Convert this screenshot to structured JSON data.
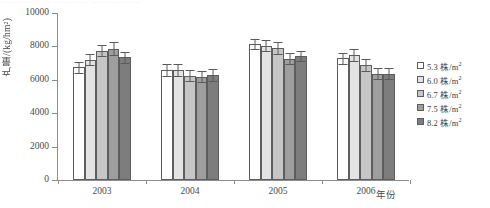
{
  "figure": {
    "top_artifact_text": "·· ··· ····· ···· ·· ···                    ···· ···· ···· ·· ···· ··· ··",
    "background_color": "#ffffff"
  },
  "chart_data": {
    "type": "bar",
    "title": "",
    "subtitle": "",
    "xlabel": "年份",
    "ylabel": "产量/(kg/hm²)",
    "categories": [
      "2003",
      "2004",
      "2005",
      "2006"
    ],
    "ylim": [
      0,
      10000
    ],
    "ytick_values": [
      0,
      2000,
      4000,
      6000,
      8000,
      10000
    ],
    "ytick_labels": [
      "0",
      "2000",
      "4000",
      "6000",
      "8000",
      "10000"
    ],
    "grid": false,
    "legend_position": "right",
    "error_bars": true,
    "series": [
      {
        "name": "5.3 株/m²",
        "color": "#ffffff",
        "values": [
          6750,
          6600,
          8130,
          7300
        ],
        "errors": [
          330,
          350,
          300,
          330
        ]
      },
      {
        "name": "6.0 株/m²",
        "color": "#e3e3e3",
        "values": [
          7200,
          6600,
          8050,
          7500
        ],
        "errors": [
          330,
          350,
          330,
          370
        ]
      },
      {
        "name": "6.7 株/m²",
        "color": "#c6c6c6",
        "values": [
          7750,
          6250,
          7900,
          6900
        ],
        "errors": [
          350,
          330,
          350,
          350
        ]
      },
      {
        "name": "7.5 株/m²",
        "color": "#9e9e9e",
        "values": [
          7870,
          6180,
          7250,
          6350
        ],
        "errors": [
          400,
          330,
          330,
          330
        ]
      },
      {
        "name": "8.2 株/m²",
        "color": "#7d7d7d",
        "values": [
          7350,
          6300,
          7400,
          6350
        ],
        "errors": [
          330,
          350,
          300,
          330
        ]
      }
    ]
  },
  "legend": {
    "items": [
      {
        "label": "5.3 株/m",
        "sup": "2",
        "color": "#ffffff"
      },
      {
        "label": "6.0 株/m",
        "sup": "2",
        "color": "#e3e3e3"
      },
      {
        "label": "6.7 株/m",
        "sup": "2",
        "color": "#c6c6c6"
      },
      {
        "label": "7.5 株/m",
        "sup": "2",
        "color": "#9e9e9e"
      },
      {
        "label": "8.2 株/m",
        "sup": "2",
        "color": "#7d7d7d"
      }
    ]
  }
}
